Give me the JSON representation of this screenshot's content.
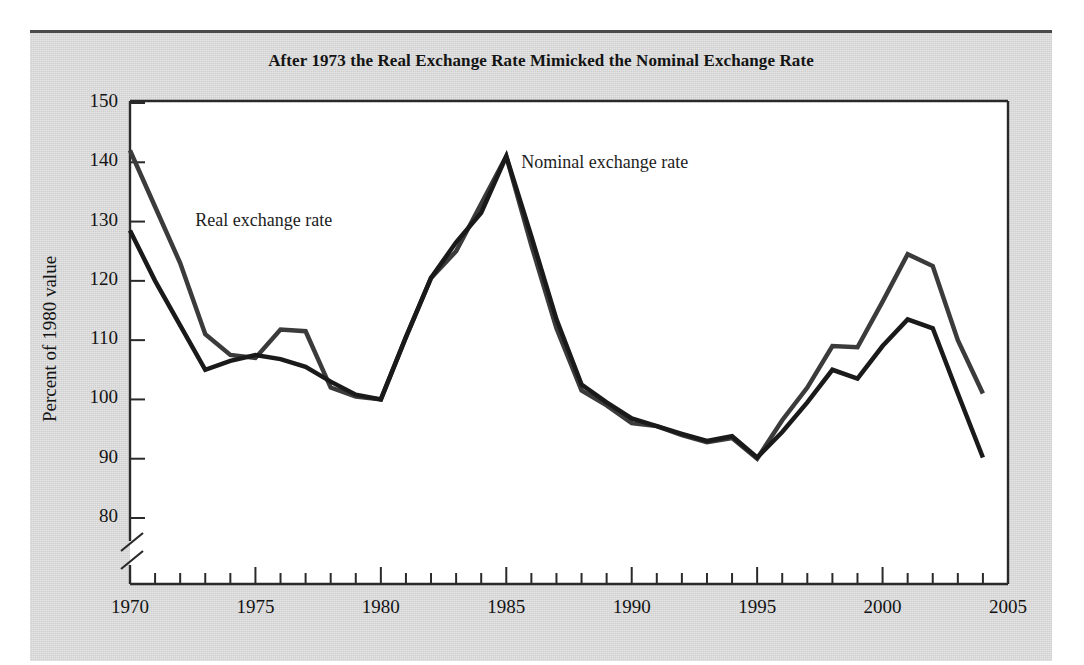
{
  "figure": {
    "background_color": "#d6d6d6",
    "plot_background_color": "#ffffff",
    "page_background_color": "#ffffff"
  },
  "annotations": {
    "real_label": "Real exchange rate",
    "nominal_label": "Nominal exchange rate"
  },
  "axis_break": {
    "present": true,
    "description": "double-slash break on y-axis below 80"
  },
  "chart_data": {
    "type": "line",
    "title": "After 1973 the Real Exchange Rate Mimicked the Nominal Exchange Rate",
    "xlabel": "",
    "ylabel": "Percent of 1980 value",
    "xlim": [
      1970,
      2005
    ],
    "ylim": [
      75,
      150
    ],
    "grid": false,
    "legend": "inline-annotations",
    "y_ticks": [
      80,
      90,
      100,
      110,
      120,
      130,
      140,
      150
    ],
    "y_tick_labels": [
      "80",
      "90",
      "100",
      "110",
      "120",
      "130",
      "140",
      "150"
    ],
    "x_ticks": [
      1970,
      1971,
      1972,
      1973,
      1974,
      1975,
      1976,
      1977,
      1978,
      1979,
      1980,
      1981,
      1982,
      1983,
      1984,
      1985,
      1986,
      1987,
      1988,
      1989,
      1990,
      1991,
      1992,
      1993,
      1994,
      1995,
      1996,
      1997,
      1998,
      1999,
      2000,
      2001,
      2002,
      2003,
      2004,
      2005
    ],
    "x_tick_labels_major": [
      "1970",
      "1975",
      "1980",
      "1985",
      "1990",
      "1995",
      "2000",
      "2005"
    ],
    "x_major_values": [
      1970,
      1975,
      1980,
      1985,
      1990,
      1995,
      2000,
      2005
    ],
    "x": [
      1970,
      1971,
      1972,
      1973,
      1974,
      1975,
      1976,
      1977,
      1978,
      1979,
      1980,
      1981,
      1982,
      1983,
      1984,
      1985,
      1986,
      1987,
      1988,
      1989,
      1990,
      1991,
      1992,
      1993,
      1994,
      1995,
      1996,
      1997,
      1998,
      1999,
      2000,
      2001,
      2002,
      2003,
      2004
    ],
    "series": [
      {
        "name": "Nominal exchange rate",
        "color": "#3b3b3b",
        "width": 4.5,
        "values": [
          142.0,
          132.5,
          123.0,
          111.0,
          107.5,
          107.0,
          111.8,
          111.5,
          102.0,
          100.5,
          100.0,
          110.5,
          120.5,
          125.0,
          133.0,
          141.0,
          126.0,
          112.0,
          101.5,
          99.0,
          96.0,
          95.5,
          94.0,
          92.8,
          93.5,
          90.0,
          96.5,
          102.0,
          109.0,
          108.8,
          116.5,
          124.5,
          122.5,
          110.0,
          101.0
        ]
      },
      {
        "name": "Real exchange rate",
        "color": "#1a1a1a",
        "width": 4.5,
        "values": [
          128.5,
          120.0,
          112.5,
          105.0,
          106.5,
          107.5,
          106.8,
          105.5,
          103.0,
          100.8,
          100.0,
          110.5,
          120.5,
          126.5,
          131.5,
          141.0,
          127.5,
          113.5,
          102.5,
          99.5,
          96.8,
          95.5,
          94.2,
          93.0,
          93.8,
          90.2,
          94.5,
          99.5,
          105.0,
          103.5,
          109.0,
          113.5,
          112.0,
          101.0,
          90.2
        ]
      }
    ]
  }
}
